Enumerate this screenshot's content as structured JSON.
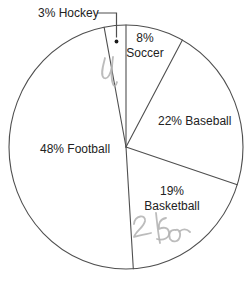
{
  "chart_data": {
    "type": "pie",
    "title": "",
    "unit": "percent",
    "direction": "clockwise",
    "start_angle_deg": 0,
    "categories": [
      "Soccer",
      "Baseball",
      "Basketball",
      "Football",
      "Hockey"
    ],
    "values": [
      8,
      22,
      19,
      48,
      3
    ],
    "legend": "none",
    "style": "outline-only, white slices, dark gray strokes"
  },
  "labels": {
    "hockey": "3% Hockey",
    "soccer_line1": "8%",
    "soccer_line2": "Soccer",
    "baseball": "22% Baseball",
    "football": "48% Football",
    "basketball_line1": "19%",
    "basketball_line2": "Basketball"
  },
  "annotations": {
    "scribble_top_text": "4",
    "scribble_bottom_text": "2550",
    "style": "faint gray pencil handwriting"
  },
  "colors": {
    "outline": "#4f4f4f",
    "text": "#222222",
    "handwriting": "#b0b0b0",
    "marker_dot": "#1a1a1a",
    "background": "#ffffff"
  }
}
